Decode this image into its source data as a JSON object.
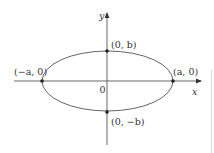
{
  "diagram": {
    "title": "",
    "axes": {
      "x_label": "x",
      "y_label": "y",
      "origin_label": "0"
    },
    "ellipse": {
      "center": [
        0,
        0
      ],
      "semi_major_axis": "a",
      "semi_minor_axis": "b"
    },
    "points": [
      {
        "id": "vertex-left",
        "label": "(−a, 0)"
      },
      {
        "id": "vertex-right",
        "label": "(a, 0)"
      },
      {
        "id": "covertex-top",
        "label": "(0, b)"
      },
      {
        "id": "covertex-bottom",
        "label": "(0, −b)"
      }
    ],
    "colors": {
      "stroke": "#444444",
      "text": "#333333",
      "background": "#ffffff"
    }
  }
}
